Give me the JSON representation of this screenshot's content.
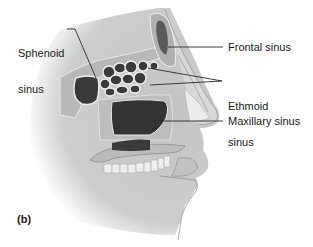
{
  "figure": {
    "panel_label": "(b)",
    "labels": {
      "sphenoid_line1": "Sphenoid",
      "sphenoid_line2": "sinus",
      "frontal": "Frontal sinus",
      "ethmoid_line1": "Ethmoid",
      "ethmoid_line2": "sinus",
      "maxillary": "Maxillary sinus"
    },
    "colors": {
      "background": "#ffffff",
      "skin": "#c9c9c9",
      "skin_light": "#e0e0e0",
      "bone": "#b5b5b5",
      "bone_outline": "#f0f0f0",
      "sinus_cavity": "#3a3a3a",
      "leader_line": "#2a2a2a",
      "text": "#1a1a1a"
    }
  }
}
